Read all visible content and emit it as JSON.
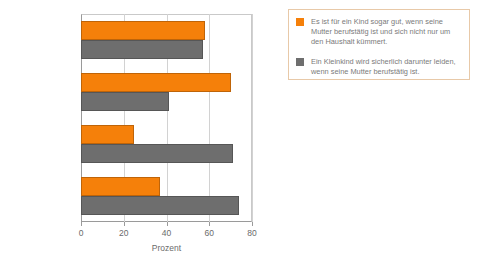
{
  "chart_data": {
    "type": "bar",
    "orientation": "horizontal",
    "title": "",
    "xlabel": "Prozent",
    "ylabel": "",
    "xlim": [
      0,
      80
    ],
    "xticks": [
      0,
      20,
      40,
      60,
      80
    ],
    "grid": true,
    "categories": [
      "Männer (Ost)",
      "Frauen (Ost)",
      "Männer (West)",
      "Frauen (West)"
    ],
    "legend_position": "right",
    "series": [
      {
        "name": "Es ist für ein Kind sogar gut, wenn seine Mutter berufstätig ist und sich nicht nur um den Haushalt kümmert.",
        "color": "#F5800A",
        "values": [
          58,
          70,
          25,
          37
        ]
      },
      {
        "name": "Ein Kleinkind wird sicherlich darunter leiden, wenn seine Mutter berufstätig ist.",
        "color": "#6E6E6E",
        "values": [
          57,
          41,
          71,
          74
        ]
      }
    ]
  },
  "legend": {
    "entries": [
      {
        "label": "Es ist für ein Kind sogar gut, wenn seine Mutter berufstätig ist und sich nicht nur um den Haushalt kümmert.",
        "color": "#F5800A"
      },
      {
        "label": "Ein Kleinkind wird sicherlich darunter leiden, wenn seine Mutter berufstätig ist.",
        "color": "#6E6E6E"
      }
    ]
  },
  "axis": {
    "x_title": "Prozent",
    "x_tick_labels": [
      "0",
      "20",
      "40",
      "60",
      "80"
    ],
    "y_tick_labels": [
      "Männer (Ost)",
      "Frauen (Ost)",
      "Männer (West)",
      "Frauen (West)"
    ]
  }
}
